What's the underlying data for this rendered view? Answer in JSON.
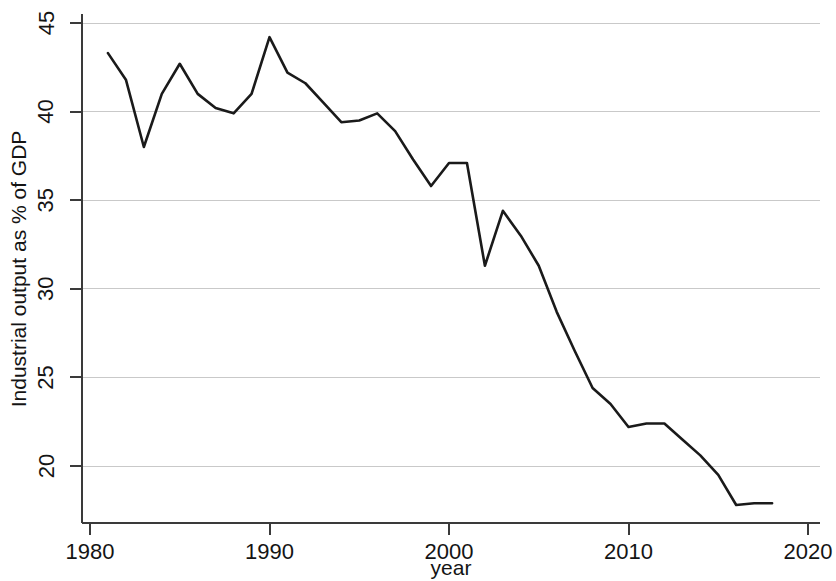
{
  "chart_data": {
    "type": "line",
    "title": "",
    "subtitle": "",
    "xlabel": "year",
    "ylabel": "Industrial output as % of GDP",
    "xlim": [
      1980,
      2020
    ],
    "ylim": [
      17.2,
      45.6
    ],
    "x_ticks": [
      1980,
      1990,
      2000,
      2010,
      2020
    ],
    "x_tick_labels": [
      "1980",
      "1990",
      "2000",
      "2010",
      "2020"
    ],
    "y_ticks": [
      20,
      25,
      30,
      35,
      40,
      45
    ],
    "y_tick_labels": [
      "20",
      "25",
      "30",
      "35",
      "40",
      "45"
    ],
    "grid": "horizontal",
    "legend": "none",
    "series": [
      {
        "name": "Industrial output as % of GDP",
        "color": "#1a1a1a",
        "x": [
          1981,
          1982,
          1983,
          1984,
          1985,
          1986,
          1987,
          1988,
          1989,
          1990,
          1991,
          1992,
          1993,
          1994,
          1995,
          1996,
          1997,
          1998,
          1999,
          2000,
          2001,
          2002,
          2003,
          2004,
          2005,
          2006,
          2007,
          2008,
          2009,
          2010,
          2011,
          2012,
          2013,
          2014,
          2015,
          2016,
          2017,
          2018
        ],
        "values": [
          43.3,
          41.8,
          38.0,
          41.0,
          42.7,
          41.0,
          40.2,
          39.9,
          41.0,
          44.2,
          42.2,
          41.6,
          40.5,
          39.4,
          39.5,
          39.9,
          38.9,
          37.3,
          35.8,
          37.1,
          37.1,
          31.3,
          34.4,
          33.0,
          31.3,
          28.7,
          26.5,
          24.4,
          23.5,
          22.2,
          22.4,
          22.4,
          21.5,
          20.6,
          19.5,
          17.8,
          17.9,
          17.9
        ]
      }
    ],
    "annotations": []
  },
  "axes": {
    "ylabel": "Industrial output as % of GDP",
    "xlabel": "year"
  },
  "colors": {
    "line": "#1a1a1a",
    "grid": "#c9c9c9",
    "axis": "#3a3a3a",
    "background": "#ffffff",
    "text": "#141414"
  }
}
